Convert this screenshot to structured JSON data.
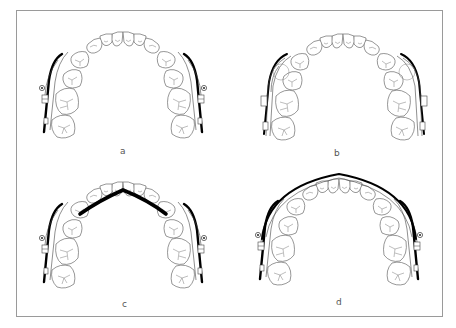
{
  "figure": {
    "type": "orthodontic-arch-diagram",
    "panels": [
      {
        "id": "a",
        "label": "a",
        "appliance": "sectional buccal wires on posterior segments"
      },
      {
        "id": "b",
        "label": "b",
        "appliance": "multiple buccal wires / overlapping posterior segments"
      },
      {
        "id": "c",
        "label": "c",
        "appliance": "sectional buccal wires with thick palatal transpalatal arch"
      },
      {
        "id": "d",
        "label": "d",
        "appliance": "sectional buccal wires with continuous labial overlay arch"
      }
    ]
  },
  "colors": {
    "border": "#9a9a9a",
    "tooth_outline": "#6a6a6a",
    "wire": "#000000",
    "label": "#555555",
    "background": "#ffffff"
  }
}
